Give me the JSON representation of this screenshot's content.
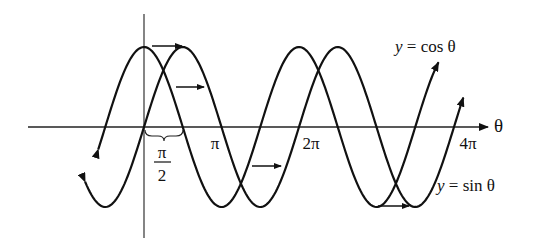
{
  "chart_data": {
    "type": "line",
    "title": "",
    "xlabel": "θ",
    "ylabel": "",
    "origin_px": [
      144,
      127
    ],
    "px_per_pi": 77.5,
    "amplitude_px": 80,
    "x_tick_labels": [
      "π/2",
      "π",
      "2π",
      "4π"
    ],
    "x_ticks": [
      1.5707963,
      3.1415926,
      6.2831853,
      12.5663706
    ],
    "ylim": [
      -1,
      1
    ],
    "grid": false,
    "series": [
      {
        "name": "y = cos θ",
        "function": "cos",
        "x_range_pi": [
          -0.59,
          3.8
        ],
        "end_arrows": true
      },
      {
        "name": "y = sin θ",
        "function": "sin",
        "x_range_pi": [
          -0.76,
          4.12
        ],
        "end_arrows": true
      }
    ],
    "annotations": [
      {
        "type": "brace",
        "from": 0,
        "to": 1.5707963,
        "label": "π/2",
        "text": "phase shift"
      },
      {
        "type": "shift-arrow",
        "note": "arrows indicating sin curve is cos shifted right by π/2"
      }
    ]
  },
  "labels": {
    "axis_theta": "θ",
    "cos_label": "y = cos θ",
    "sin_label": "y = sin θ",
    "tick_pi_over_2_num": "π",
    "tick_pi_over_2_den": "2",
    "tick_pi": "π",
    "tick_2pi": "2π",
    "tick_4pi": "4π"
  }
}
